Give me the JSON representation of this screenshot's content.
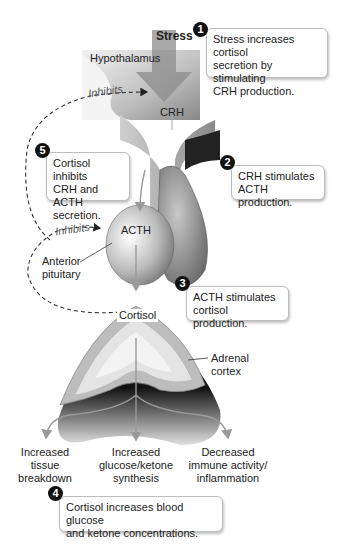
{
  "labels": {
    "stress": "Stress",
    "hypothalamus": "Hypothalamus",
    "crh": "CRH",
    "inhibits_top": "Inhibits",
    "inhibits_mid": "Inhibits",
    "acth": "ACTH",
    "anterior_pituitary_1": "Anterior",
    "anterior_pituitary_2": "pituitary",
    "cortisol": "Cortisol",
    "adrenal_cortex_1": "Adrenal",
    "adrenal_cortex_2": "cortex"
  },
  "effects": [
    {
      "lines": [
        "Increased",
        "tissue",
        "breakdown"
      ]
    },
    {
      "lines": [
        "Increased",
        "glucose/ketone",
        "synthesis"
      ]
    },
    {
      "lines": [
        "Decreased",
        "immune activity/",
        "inflammation"
      ]
    }
  ],
  "steps": [
    {
      "number": "1",
      "lines": [
        "Stress increases cortisol",
        "secretion by stimulating",
        "CRH production."
      ]
    },
    {
      "number": "2",
      "lines": [
        "CRH stimulates",
        "ACTH production."
      ]
    },
    {
      "number": "3",
      "lines": [
        "ACTH stimulates",
        "cortisol production."
      ]
    },
    {
      "number": "4",
      "lines": [
        "Cortisol increases blood glucose",
        "and ketone concentrations."
      ]
    },
    {
      "number": "5",
      "lines": [
        "Cortisol inhibits",
        "CRH and ACTH",
        "secretion."
      ]
    }
  ],
  "colors": {
    "badge": "#111111",
    "arrow": "#9a9a9a",
    "dashed": "#333333"
  }
}
